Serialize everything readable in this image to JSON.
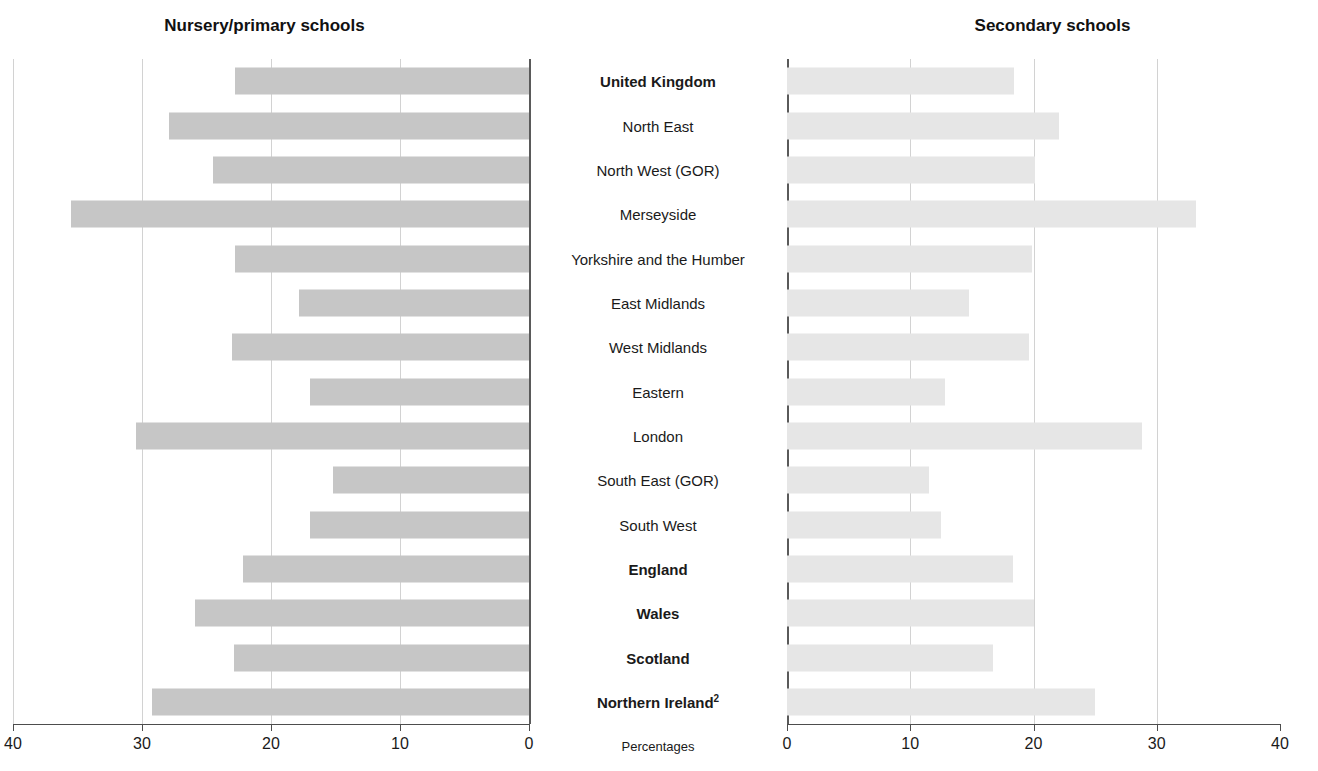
{
  "titles": {
    "left": "Nursery/primary schools",
    "right": "Secondary schools"
  },
  "axis_caption": "Percentages",
  "chart_data": {
    "type": "bar",
    "subtitle": "",
    "orientation": "horizontal",
    "layout": "back-to-back paired bar chart (population-pyramid style)",
    "xlabel": "Percentages",
    "ylabel": "",
    "grid": true,
    "legend_position": "none",
    "categories": [
      "United Kingdom",
      "North East",
      "North West (GOR)",
      "Merseyside",
      "Yorkshire and the Humber",
      "East Midlands",
      "West Midlands",
      "Eastern",
      "London",
      "South East (GOR)",
      "South West",
      "England",
      "Wales",
      "Scotland",
      "Northern Ireland"
    ],
    "category_footnotes": {
      "Northern Ireland": "2"
    },
    "bold_categories": [
      "United Kingdom",
      "England",
      "Wales",
      "Scotland",
      "Northern Ireland"
    ],
    "series": [
      {
        "name": "Nursery/primary schools",
        "side": "left",
        "color": "#c6c6c6",
        "axis_direction": "reversed",
        "xlim": [
          0,
          40
        ],
        "xticks": [
          40,
          30,
          20,
          10,
          0
        ],
        "values": [
          22.8,
          27.9,
          24.5,
          35.5,
          22.8,
          17.8,
          23.0,
          17.0,
          30.5,
          15.2,
          17.0,
          22.2,
          25.9,
          22.9,
          29.2
        ]
      },
      {
        "name": "Secondary schools",
        "side": "right",
        "color": "#e6e6e6",
        "axis_direction": "normal",
        "xlim": [
          0,
          40
        ],
        "xticks": [
          0,
          10,
          20,
          30,
          40
        ],
        "values": [
          18.4,
          22.1,
          20.1,
          33.2,
          19.9,
          14.8,
          19.6,
          12.8,
          28.8,
          11.5,
          12.5,
          18.3,
          20.0,
          16.7,
          25.0
        ]
      }
    ]
  }
}
